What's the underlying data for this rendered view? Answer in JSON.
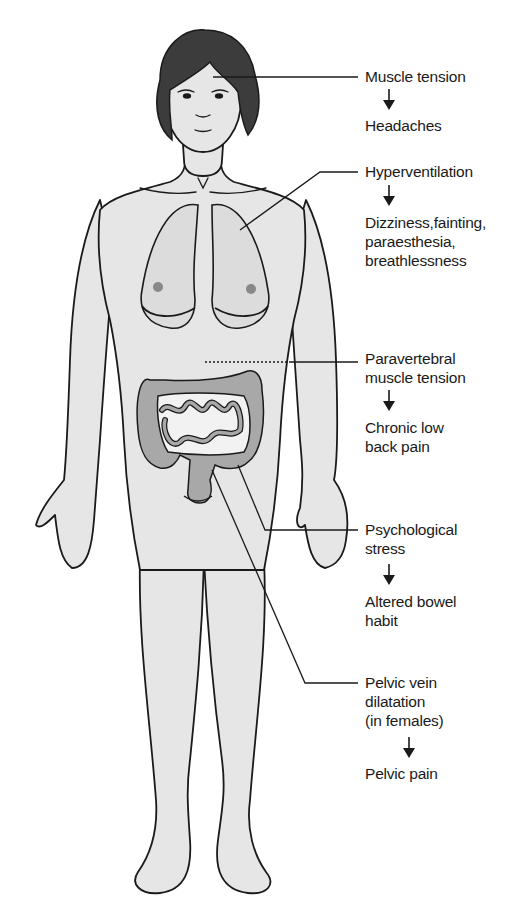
{
  "diagram": {
    "type": "anatomical-annotation",
    "colors": {
      "skin": "#e6e6e6",
      "hair": "#3c3c3c",
      "organs": "#a8a8a8",
      "outline": "#1a1a1a",
      "text": "#1a1a1a",
      "background": "#ffffff"
    },
    "annotations": [
      {
        "id": "head",
        "cause": "Muscle tension",
        "effect": "Headaches"
      },
      {
        "id": "lungs",
        "cause": "Hyperventilation",
        "effect": "Dizziness,fainting,\nparaesthesia,\nbreathlessness"
      },
      {
        "id": "back",
        "cause": "Paravertebral\nmuscle tension",
        "effect": "Chronic low\nback pain"
      },
      {
        "id": "bowel",
        "cause": "Psychological\nstress",
        "effect": "Altered bowel\nhabit"
      },
      {
        "id": "pelvis",
        "cause": "Pelvic vein\ndilatation\n(in females)",
        "effect": "Pelvic pain"
      }
    ]
  }
}
